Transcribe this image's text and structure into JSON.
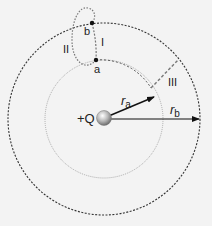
{
  "labels": {
    "charge": "+Q",
    "point_a": "a",
    "point_b": "b",
    "path_1": "I",
    "path_2": "II",
    "path_3": "III",
    "radius_a": "r",
    "radius_a_sub": "a",
    "radius_b": "r",
    "radius_b_sub": "b"
  },
  "geometry": {
    "center": [
      104,
      119
    ],
    "inner_radius": 59,
    "outer_radius": 96
  },
  "colors": {
    "background": "#f3f3f3",
    "line": "#222222",
    "inner_circle": "#888888",
    "path_dashed": "#777777"
  }
}
